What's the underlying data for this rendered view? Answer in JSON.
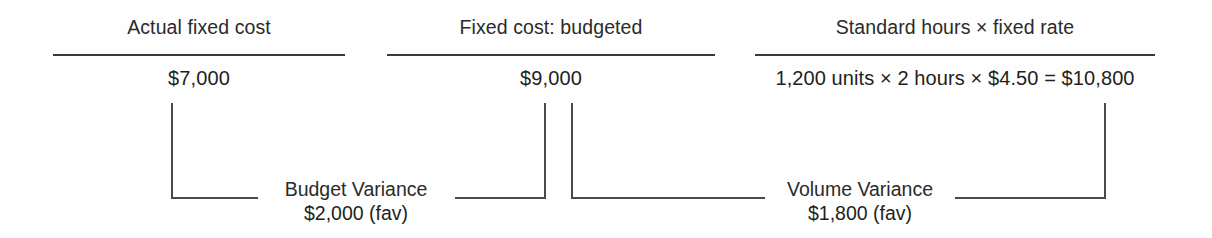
{
  "diagram": {
    "type": "fixed-overhead-variance-analysis",
    "columns": [
      {
        "id": "actual-fixed-cost",
        "title": "Actual fixed cost",
        "value": "$7,000"
      },
      {
        "id": "fixed-cost-budgeted",
        "title": "Fixed cost: budgeted",
        "value": "$9,000"
      },
      {
        "id": "standard-hours-fixed-rate",
        "title": "Standard hours × fixed rate",
        "value": "1,200 units × 2 hours × $4.50 = $10,800"
      }
    ],
    "variances": [
      {
        "id": "budget-variance",
        "name": "Budget Variance",
        "amount": "$2,000 (fav)"
      },
      {
        "id": "volume-variance",
        "name": "Volume Variance",
        "amount": "$1,800 (fav)"
      }
    ],
    "colors": {
      "background": "#fefefe",
      "text": "#231f20",
      "rule": "#3a3a3a",
      "bracket": "#4a4a4a"
    }
  }
}
